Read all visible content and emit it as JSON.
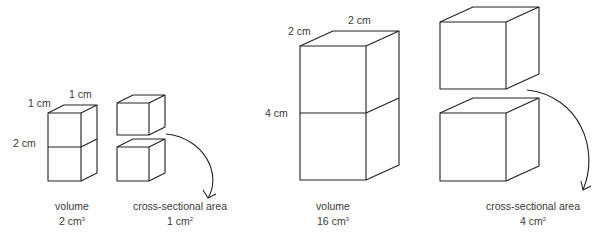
{
  "small_stack": {
    "width_label": "1 cm",
    "depth_label": "1 cm",
    "height_label": "2 cm",
    "caption_title": "volume",
    "caption_value": "2 cm",
    "caption_exp": "3"
  },
  "small_split": {
    "caption_title": "cross-sectional area",
    "caption_value": "1 cm",
    "caption_exp": "2"
  },
  "large_stack": {
    "width_label": "2 cm",
    "depth_label": "2 cm",
    "height_label": "4 cm",
    "caption_title": "volume",
    "caption_value": "16 cm",
    "caption_exp": "3"
  },
  "large_split": {
    "caption_title": "cross-sectional area",
    "caption_value": "4 cm",
    "caption_exp": "2"
  },
  "colors": {
    "line": "#222222",
    "text": "#3a3a3a"
  }
}
